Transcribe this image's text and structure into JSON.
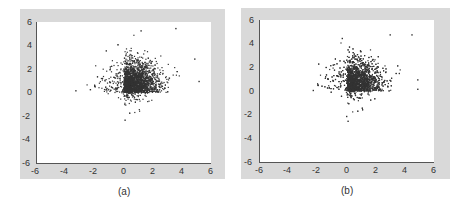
{
  "chart_data": [
    {
      "type": "scatter",
      "panel_label": "(a)",
      "title": "",
      "xlabel": "",
      "ylabel": "",
      "xlim": [
        -6,
        6
      ],
      "ylim": [
        -6,
        6
      ],
      "xticks": [
        -6,
        -4,
        -2,
        0,
        2,
        4,
        6
      ],
      "yticks": [
        -6,
        -4,
        -2,
        0,
        2,
        4,
        6
      ],
      "grid": false,
      "description": "Dense cluster of ~3000 points concentrated in x∈[0,2], y∈[0,2] with a sharp lower-left boundary at x≈0, y≈0; sparse spread to x≈5, y≈5.3; a few outliers to x≈-3.3 at y≈0.2 and down to y≈-2.3 near x≈0.",
      "cluster": {
        "x_core": [
          0,
          2.2
        ],
        "y_core": [
          0,
          2.5
        ],
        "x_extent": [
          -3.4,
          5.3
        ],
        "y_extent": [
          -2.4,
          5.5
        ]
      },
      "notable_points": [
        {
          "x": -3.3,
          "y": 0.2
        },
        {
          "x": -2.3,
          "y": 0.3
        },
        {
          "x": -2.0,
          "y": 0.6
        },
        {
          "x": -1.2,
          "y": 3.6
        },
        {
          "x": 0.1,
          "y": -2.3
        },
        {
          "x": 1.2,
          "y": 5.3
        },
        {
          "x": 3.6,
          "y": 5.5
        },
        {
          "x": 5.2,
          "y": 1.0
        },
        {
          "x": 4.9,
          "y": 2.9
        }
      ]
    },
    {
      "type": "scatter",
      "panel_label": "(b)",
      "title": "",
      "xlabel": "",
      "ylabel": "",
      "xlim": [
        -6,
        6
      ],
      "ylim": [
        -6,
        6
      ],
      "xticks": [
        -6,
        -4,
        -2,
        0,
        2,
        4,
        6
      ],
      "yticks": [
        -6,
        -4,
        -2,
        0,
        2,
        4,
        6
      ],
      "grid": false,
      "description": "Dense cluster of ~3000 points concentrated in x∈[0,2], y∈[0,2] with sharp lower-left boundary at x≈0, y≈0; sparse spread to x≈5, y≈4.8; outliers to x≈-2.3 at y≈0.1 and down to y≈-2.5 near x≈0.",
      "cluster": {
        "x_core": [
          0,
          2.2
        ],
        "y_core": [
          0,
          2.5
        ],
        "x_extent": [
          -2.4,
          5.0
        ],
        "y_extent": [
          -2.5,
          4.8
        ]
      },
      "notable_points": [
        {
          "x": -2.3,
          "y": 0.1
        },
        {
          "x": -1.1,
          "y": 2.2
        },
        {
          "x": -0.3,
          "y": 4.5
        },
        {
          "x": 0.0,
          "y": -2.1
        },
        {
          "x": 0.1,
          "y": -2.5
        },
        {
          "x": 3.0,
          "y": 4.8
        },
        {
          "x": 4.5,
          "y": 4.8
        },
        {
          "x": 4.9,
          "y": 0.2
        },
        {
          "x": 4.9,
          "y": 1.0
        }
      ]
    }
  ],
  "panels": [
    {
      "label": "(a)",
      "ticks": {
        "x": [
          "-6",
          "-4",
          "-2",
          "0",
          "2",
          "4",
          "6"
        ],
        "y": [
          "6",
          "4",
          "2",
          "0",
          "-2",
          "-4",
          "-6"
        ]
      }
    },
    {
      "label": "(b)",
      "ticks": {
        "x": [
          "-6",
          "-4",
          "-2",
          "0",
          "2",
          "4",
          "6"
        ],
        "y": [
          "6",
          "4",
          "2",
          "0",
          "-2",
          "-4",
          "-6"
        ]
      }
    }
  ],
  "colors": {
    "frame": "#d9d9d9",
    "points": "#333333",
    "plot_bg": "#ffffff"
  }
}
